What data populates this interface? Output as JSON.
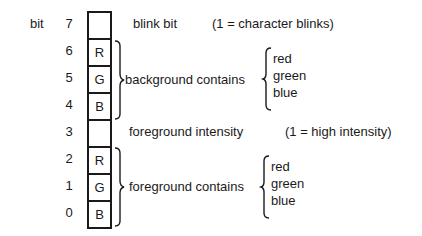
{
  "bit_label": "bit",
  "bits": [
    {
      "index": "7",
      "content": ""
    },
    {
      "index": "6",
      "content": "R"
    },
    {
      "index": "5",
      "content": "G"
    },
    {
      "index": "4",
      "content": "B"
    },
    {
      "index": "3",
      "content": ""
    },
    {
      "index": "2",
      "content": "R"
    },
    {
      "index": "1",
      "content": "G"
    },
    {
      "index": "0",
      "content": "B"
    }
  ],
  "annotations": {
    "blink": {
      "label": "blink bit",
      "note": "(1 = character blinks)"
    },
    "background": {
      "label": "background contains",
      "colors": [
        "red",
        "green",
        "blue"
      ]
    },
    "intensity": {
      "label": "foreground intensity",
      "note": "(1 = high intensity)"
    },
    "foreground": {
      "label": "foreground contains",
      "colors": [
        "red",
        "green",
        "blue"
      ]
    }
  }
}
